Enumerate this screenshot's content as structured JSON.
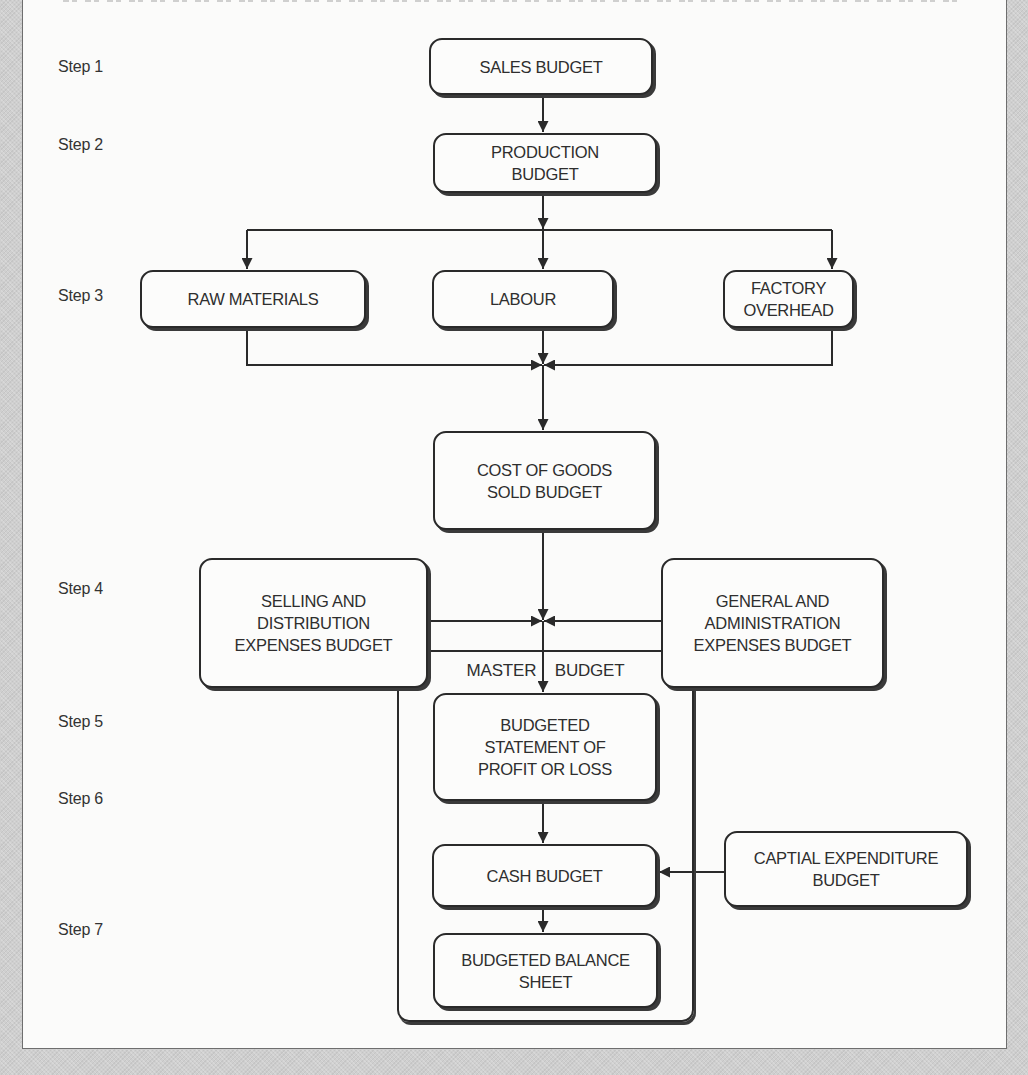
{
  "diagram": {
    "type": "flowchart",
    "steps": [
      {
        "id": "step1",
        "label": "Step 1"
      },
      {
        "id": "step2",
        "label": "Step 2"
      },
      {
        "id": "step3",
        "label": "Step 3"
      },
      {
        "id": "step4",
        "label": "Step 4"
      },
      {
        "id": "step5",
        "label": "Step 5"
      },
      {
        "id": "step6",
        "label": "Step 6"
      },
      {
        "id": "step7",
        "label": "Step 7"
      }
    ],
    "nodes": {
      "sales_budget": "SALES BUDGET",
      "production_budget": "PRODUCTION\nBUDGET",
      "raw_materials": "RAW MATERIALS",
      "labour": "LABOUR",
      "factory_overhead": "FACTORY\nOVERHEAD",
      "cogs_budget": "COST OF GOODS\nSOLD BUDGET",
      "selling_distribution": "SELLING AND\nDISTRIBUTION\nEXPENSES BUDGET",
      "general_admin": "GENERAL AND\nADMINISTRATION\nEXPENSES BUDGET",
      "profit_loss": "BUDGETED\nSTATEMENT OF\nPROFIT OR LOSS",
      "cash_budget": "CASH BUDGET",
      "capital_expenditure": "CAPTIAL EXPENDITURE\nBUDGET",
      "balance_sheet": "BUDGETED BALANCE\nSHEET"
    },
    "group": {
      "label": "MASTER BUDGET",
      "members": [
        "profit_loss",
        "cash_budget",
        "balance_sheet"
      ]
    },
    "edges": [
      {
        "from": "sales_budget",
        "to": "production_budget"
      },
      {
        "from": "production_budget",
        "to": "raw_materials"
      },
      {
        "from": "production_budget",
        "to": "labour"
      },
      {
        "from": "production_budget",
        "to": "factory_overhead"
      },
      {
        "from": "raw_materials",
        "to": "cogs_budget"
      },
      {
        "from": "labour",
        "to": "cogs_budget"
      },
      {
        "from": "factory_overhead",
        "to": "cogs_budget"
      },
      {
        "from": "cogs_budget",
        "to": "profit_loss"
      },
      {
        "from": "selling_distribution",
        "to": "profit_loss"
      },
      {
        "from": "general_admin",
        "to": "profit_loss"
      },
      {
        "from": "profit_loss",
        "to": "cash_budget"
      },
      {
        "from": "capital_expenditure",
        "to": "cash_budget"
      },
      {
        "from": "cash_budget",
        "to": "balance_sheet"
      }
    ]
  },
  "colors": {
    "line": "#2a2a2a",
    "box_fill": "#fcfcfb",
    "page": "#fbfbfa",
    "margin": "#cfcfcf"
  }
}
